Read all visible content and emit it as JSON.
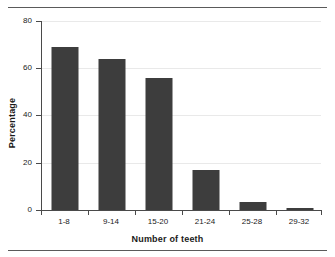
{
  "chart_data": {
    "type": "bar",
    "title": "",
    "subtitle": "",
    "xlabel": "Number of teeth",
    "ylabel": "Percentage",
    "categories": [
      "1-8",
      "9-14",
      "15-20",
      "21-24",
      "25-28",
      "29-32"
    ],
    "values": [
      69,
      64,
      56,
      17,
      3.4,
      1
    ],
    "series": [
      {
        "name": "Percentage",
        "values": [
          69,
          64,
          56,
          17,
          3.4,
          1
        ]
      }
    ],
    "ylim": [
      0,
      80
    ],
    "yticks": [
      0,
      20,
      40,
      60,
      80
    ],
    "ytick_labels": [
      "0",
      "20",
      "40",
      "60",
      "80"
    ],
    "grid": true,
    "grid_axis": "y",
    "legend": false,
    "legend_position": "none",
    "bar_color": "#3d3d3d",
    "grid_color": "#e9e9e9",
    "axis_color": "#4a4a4a",
    "background": "#ffffff",
    "annotations": []
  },
  "figure": {
    "rule_top": "",
    "rule_bottom": ""
  }
}
